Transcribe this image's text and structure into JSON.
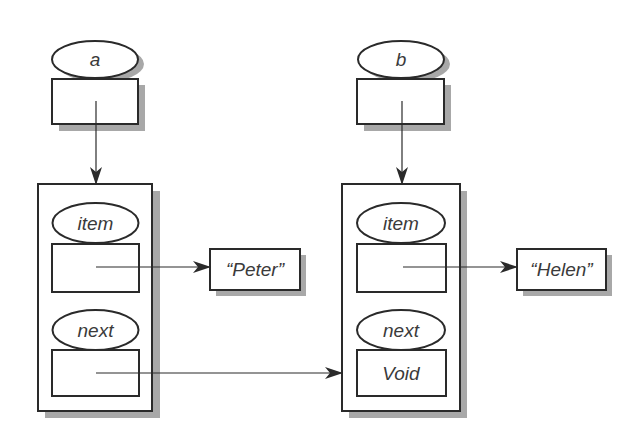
{
  "colors": {
    "stroke": "#2a2a2a",
    "shadow": "#a8a8a8",
    "fill": "#ffffff",
    "text": "#3a3a3a"
  },
  "references": [
    {
      "id": "a",
      "label": "a"
    },
    {
      "id": "b",
      "label": "b"
    }
  ],
  "nodes": [
    {
      "id": "node1",
      "fields": [
        {
          "name": "item",
          "value": ""
        },
        {
          "name": "next",
          "value": ""
        }
      ],
      "item_target": "“Peter”"
    },
    {
      "id": "node2",
      "fields": [
        {
          "name": "item",
          "value": ""
        },
        {
          "name": "next",
          "value": "Void"
        }
      ],
      "item_target": "“Helen”"
    }
  ],
  "edges": [
    {
      "from": "a",
      "to": "node1"
    },
    {
      "from": "b",
      "to": "node2"
    },
    {
      "from": "node1.item",
      "to": "“Peter”"
    },
    {
      "from": "node2.item",
      "to": "“Helen”"
    },
    {
      "from": "node1.next",
      "to": "node2"
    }
  ]
}
